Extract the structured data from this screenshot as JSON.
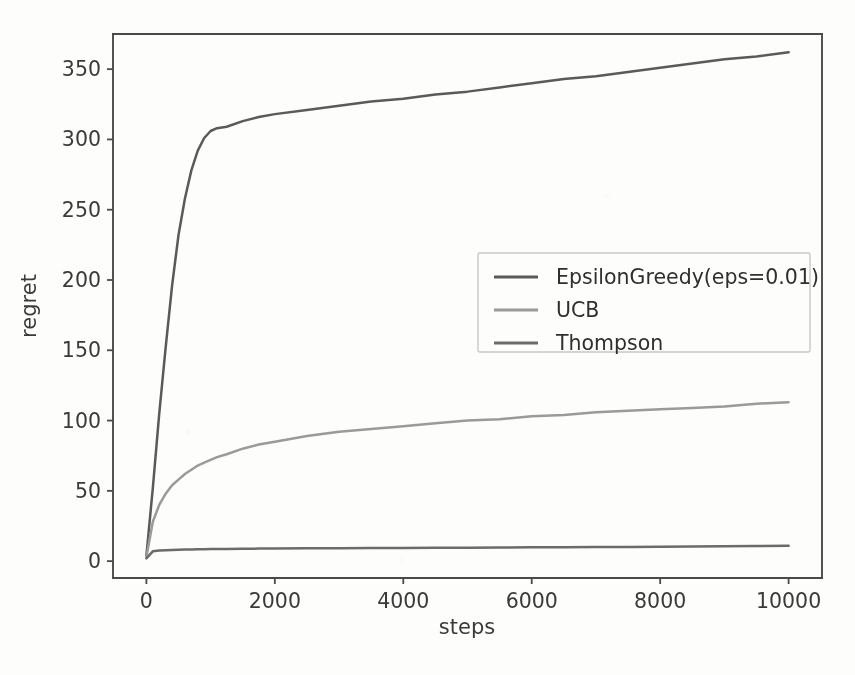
{
  "chart_data": {
    "type": "line",
    "title": "",
    "xlabel": "steps",
    "ylabel": "regret",
    "xlim": [
      -520,
      10520
    ],
    "ylim": [
      -12,
      375
    ],
    "xticks": [
      0,
      2000,
      4000,
      6000,
      8000,
      10000
    ],
    "xticklabels": [
      "0",
      "2000",
      "4000",
      "6000",
      "8000",
      "10000"
    ],
    "yticks": [
      0,
      50,
      100,
      150,
      200,
      250,
      300,
      350
    ],
    "yticklabels": [
      "0",
      "50",
      "100",
      "150",
      "200",
      "250",
      "300",
      "350"
    ],
    "grid": false,
    "legend_position": "center right",
    "x": [
      0,
      100,
      200,
      300,
      400,
      500,
      600,
      700,
      800,
      900,
      1000,
      1100,
      1250,
      1500,
      1750,
      2000,
      2500,
      3000,
      3500,
      4000,
      4500,
      5000,
      5500,
      6000,
      6500,
      7000,
      7500,
      8000,
      8500,
      9000,
      9500,
      10000
    ],
    "series": [
      {
        "name": "EpsilonGreedy(eps=0.01)",
        "color": "#5a5a5a",
        "values": [
          4,
          52,
          105,
          152,
          196,
          232,
          258,
          278,
          292,
          301,
          306,
          308,
          309,
          313,
          316,
          318,
          321,
          324,
          327,
          329,
          332,
          334,
          337,
          340,
          343,
          345,
          348,
          351,
          354,
          357,
          359,
          362
        ]
      },
      {
        "name": "UCB",
        "color": "#9a9a9a",
        "values": [
          3,
          28,
          40,
          48,
          54,
          58,
          62,
          65,
          68,
          70,
          72,
          74,
          76,
          80,
          83,
          85,
          89,
          92,
          94,
          96,
          98,
          100,
          101,
          103,
          104,
          106,
          107,
          108,
          109,
          110,
          112,
          113
        ]
      },
      {
        "name": "Thompson",
        "color": "#6b6b6b",
        "values": [
          2,
          7,
          7.5,
          7.8,
          8.0,
          8.1,
          8.2,
          8.3,
          8.4,
          8.5,
          8.6,
          8.6,
          8.7,
          8.8,
          8.9,
          9.0,
          9.1,
          9.2,
          9.3,
          9.4,
          9.5,
          9.6,
          9.7,
          9.8,
          9.9,
          10.0,
          10.1,
          10.2,
          10.4,
          10.6,
          10.8,
          11.0
        ]
      }
    ]
  }
}
